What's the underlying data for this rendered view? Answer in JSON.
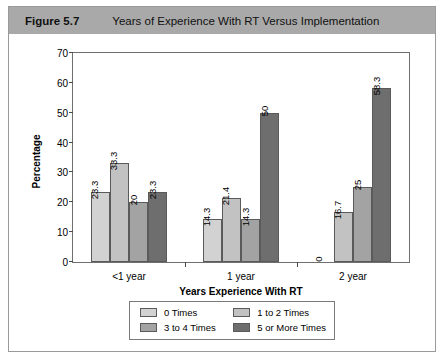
{
  "header": {
    "figure_number": "Figure 5.7",
    "caption": "Years of Experience With RT Versus Implementation",
    "bar_color": "#a9a9a9"
  },
  "chart_data": {
    "type": "bar",
    "title": "Years of Experience With RT Versus Implementation",
    "xlabel": "Years Experience With RT",
    "ylabel": "Percentage",
    "categories": [
      "<1 year",
      "1 year",
      "2 year"
    ],
    "series": [
      {
        "name": "0 Times",
        "color": "#d2d2d2",
        "values": [
          23.3,
          14.3,
          0
        ]
      },
      {
        "name": "1 to 2 Times",
        "color": "#c2c2c2",
        "values": [
          33.3,
          21.4,
          16.7
        ]
      },
      {
        "name": "3 to 4 Times",
        "color": "#a3a3a3",
        "values": [
          20,
          14.3,
          25
        ]
      },
      {
        "name": "5 or More Times",
        "color": "#6e6e6e",
        "values": [
          23.3,
          50,
          58.3
        ]
      }
    ],
    "value_labels": [
      [
        "23.3",
        "33.3",
        "20",
        "23.3"
      ],
      [
        "14.3",
        "21.4",
        "14.3",
        "50"
      ],
      [
        "0",
        "16.7",
        "25",
        "58.3"
      ]
    ],
    "ylim": [
      0,
      70
    ],
    "yticks": [
      0,
      10,
      20,
      30,
      40,
      50,
      60,
      70
    ],
    "ytick_labels": [
      "0",
      "10",
      "20",
      "30",
      "40",
      "50",
      "60",
      "70"
    ],
    "grid": false,
    "legend_position": "bottom"
  }
}
